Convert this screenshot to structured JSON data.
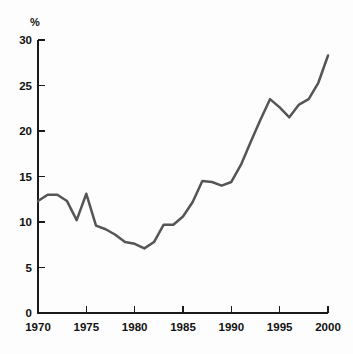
{
  "chart_data": {
    "type": "line",
    "title": "",
    "subtitle": "",
    "xlabel": "",
    "ylabel": "%",
    "unit_label": "%",
    "xlim": [
      1970,
      2000
    ],
    "ylim": [
      0,
      30
    ],
    "grid": false,
    "legend": "none",
    "x_ticks": [
      "1970",
      "1975",
      "1980",
      "1985",
      "1990",
      "1995",
      "2000"
    ],
    "x_tick_values": [
      1970,
      1975,
      1980,
      1985,
      1990,
      1995,
      2000
    ],
    "y_ticks": [
      "0",
      "5",
      "10",
      "15",
      "20",
      "25",
      "30"
    ],
    "y_tick_values": [
      0,
      5,
      10,
      15,
      20,
      25,
      30
    ],
    "line_color": "#555555",
    "axis_color": "#1a1a1a",
    "background_color": "#fdfdfd",
    "series": [
      {
        "name": "",
        "x": [
          1970,
          1971,
          1972,
          1973,
          1974,
          1975,
          1976,
          1977,
          1978,
          1979,
          1980,
          1981,
          1982,
          1983,
          1984,
          1985,
          1986,
          1987,
          1988,
          1989,
          1990,
          1991,
          1992,
          1993,
          1994,
          1995,
          1996,
          1997,
          1998,
          1999,
          2000
        ],
        "values": [
          12.3,
          13.0,
          13.0,
          12.3,
          10.2,
          13.1,
          9.6,
          9.2,
          8.6,
          7.8,
          7.6,
          7.1,
          7.8,
          9.7,
          9.7,
          10.6,
          12.2,
          14.5,
          14.4,
          14.0,
          14.4,
          16.3,
          18.8,
          21.2,
          23.5,
          22.6,
          21.5,
          22.9,
          23.5,
          25.3,
          28.3
        ]
      }
    ]
  },
  "axes": {
    "y_unit": "%"
  }
}
